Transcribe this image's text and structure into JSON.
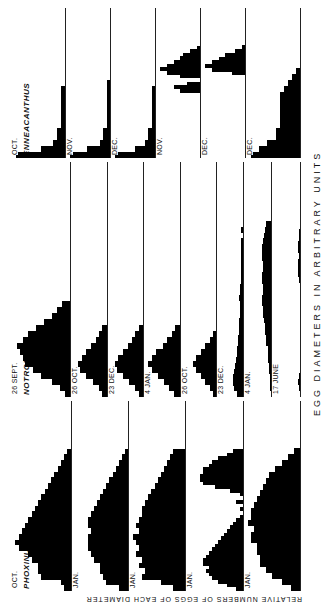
{
  "figure": {
    "y_axis_label": "RELATIVE NUMBERS OF EGGS OF EACH DIAMETER",
    "x_axis_label": "EGG DIAMETERS IN ARBITRARY UNITS"
  },
  "chart_data": [
    {
      "type": "bar",
      "title": "PHOXINUS",
      "xlabel": "EGG DIAMETERS IN ARBITRARY UNITS",
      "ylabel": "RELATIVE NUMBERS OF EGGS OF EACH DIAMETER",
      "panels": [
        {
          "date": "OCT.",
          "condition": [
            "INITIAL CONTROL",
            "FROM NATURE"
          ],
          "values": [
            2,
            3,
            9,
            10,
            10,
            12,
            13,
            16,
            17,
            16,
            15,
            14,
            13,
            12,
            11,
            10,
            9,
            8,
            7,
            6,
            5,
            4,
            3,
            2,
            1
          ]
        },
        {
          "date": "JAN.",
          "condition": [
            "SHORT PHOTOPERIOD",
            "(NORMAL DAYLIGHT)",
            "17°C"
          ],
          "values": [
            3,
            7,
            8,
            9,
            9,
            11,
            12,
            13,
            13,
            13,
            12,
            13,
            13,
            12,
            11,
            10,
            9,
            8,
            7,
            6,
            5,
            4,
            3,
            2,
            1
          ]
        },
        {
          "date": "JAN.",
          "condition": [
            "LONG PHOTOPERIOD",
            "(17 HOURS PER DAY)",
            "7°C"
          ],
          "values": [
            4,
            8,
            14,
            13,
            15,
            14,
            16,
            15,
            16,
            17,
            15,
            16,
            15,
            14,
            14,
            13,
            12,
            11,
            10,
            9,
            8,
            7,
            6,
            5,
            4
          ]
        },
        {
          "date": "JAN.",
          "condition": [
            "LONG PHOTOPERIOD",
            "(17 HOURS PER DAY)",
            "17°C"
          ],
          "values": [
            2,
            5,
            8,
            10,
            11,
            12,
            11,
            13,
            13,
            12,
            11,
            10,
            9,
            8,
            7,
            6,
            5,
            4,
            3,
            2,
            1,
            0,
            1,
            0,
            2,
            0,
            1,
            4,
            9,
            13,
            14,
            14,
            13,
            13,
            11,
            10,
            8,
            5,
            3
          ]
        },
        {
          "date": "JAN.",
          "condition": [
            "SHORT PHOTOPERIOD",
            "(NORMAL DAYLIGHT)",
            "7°C"
          ],
          "values": [
            3,
            6,
            9,
            11,
            13,
            13,
            14,
            14,
            16,
            16,
            15,
            17,
            16,
            16,
            15,
            14,
            13,
            12,
            11,
            10,
            8,
            6,
            4,
            2
          ]
        }
      ]
    },
    {
      "type": "bar",
      "title": "NOTROPIS",
      "xlabel": "EGG DIAMETERS IN ARBITRARY UNITS",
      "ylabel": "RELATIVE NUMBERS OF EGGS OF EACH DIAMETER",
      "panels": [
        {
          "date": "26 SEPT.",
          "condition": [
            "INITIAL CONTROL",
            "FROM NATURE"
          ],
          "values": [
            2,
            4,
            7,
            11,
            14,
            17,
            18,
            19,
            20,
            18,
            16,
            13,
            10,
            7,
            5,
            3
          ]
        },
        {
          "date": "26 OCT.",
          "condition": [
            "SHORT PHOTOPERIOD",
            "(NORMAL DAYLIGHT)",
            "18.9°C"
          ],
          "values": [
            3,
            5,
            9,
            13,
            17,
            18,
            16,
            13,
            10,
            7,
            5,
            3
          ]
        },
        {
          "date": "23 DEC.",
          "condition": [
            "SHORT PHOTOPERIOD",
            "(NORMAL DAYLIGHT)",
            "18.9°C"
          ],
          "values": [
            3,
            5,
            9,
            13,
            17,
            18,
            16,
            13,
            10,
            7,
            5,
            3
          ]
        },
        {
          "date": "4 JAN.",
          "condition": [
            "SHORT PHOTOPERIOD",
            "(NORMAL DAYLIGHT)",
            "18.9°C"
          ],
          "values": [
            4,
            7,
            10,
            14,
            18,
            20,
            18,
            15,
            11,
            8,
            5,
            3
          ]
        },
        {
          "date": "26 OCT.",
          "condition": [
            "LONG PHOTOPERIOD",
            "(17 HOURS PER DAY)",
            "18.9°C"
          ],
          "values": [
            2,
            4,
            7,
            10,
            13,
            15,
            13,
            10,
            7,
            4,
            2
          ]
        },
        {
          "date": "23 DEC.",
          "condition": [
            "LONG PHOTOPERIOD",
            "(17 HOURS PER DAY)",
            "18.9°C"
          ],
          "values": [
            5,
            8,
            9,
            9,
            8,
            7,
            6,
            5,
            5,
            4,
            4,
            3,
            3,
            3,
            2,
            2,
            2,
            3,
            2,
            2,
            1,
            1,
            1,
            1,
            1,
            1,
            1,
            1,
            0,
            1,
            0
          ]
        },
        {
          "date": "4 JAN.",
          "condition": [
            "LONG PHOTOPERIOD",
            "(17 HOURS PER DAY)",
            "18.9°C"
          ],
          "values": [
            0,
            1,
            1,
            1,
            2,
            2,
            3,
            3,
            3,
            4,
            4,
            5,
            5,
            6,
            7,
            7,
            8,
            8,
            7,
            7,
            8,
            8,
            7,
            7,
            8,
            8,
            8,
            7,
            6,
            5,
            4
          ]
        },
        {
          "date": "17 JUNE",
          "condition": [
            "DAYLIGHT SINCE SEPT. 26",
            "18.9°C"
          ],
          "values": [
            0,
            1,
            2,
            1,
            0,
            0,
            0,
            0,
            0,
            0,
            0,
            0,
            0,
            0,
            0,
            0,
            0,
            0,
            0,
            1,
            2,
            2,
            2,
            1,
            2,
            2,
            1,
            1,
            0
          ]
        }
      ]
    },
    {
      "type": "bar",
      "title": "ENNEACANTHUS",
      "xlabel": "EGG DIAMETERS IN ARBITRARY UNITS",
      "ylabel": "RELATIVE NUMBERS OF EGGS OF EACH DIAMETER",
      "panels": [
        {
          "date": "OCT.",
          "condition": [
            "INITIAL CONTROL",
            "FROM NATURE"
          ],
          "values": [
            12,
            6,
            3,
            2,
            2,
            1,
            1,
            1,
            1,
            1,
            1,
            1
          ]
        },
        {
          "date": "NOV.",
          "condition": [
            "SHORT PHOTOPERIOD",
            "(NORMAL DAYLIGHT)",
            "21.7°C"
          ],
          "values": [
            12,
            7,
            3,
            2,
            2,
            1,
            1,
            1,
            1,
            1,
            1,
            1,
            1
          ]
        },
        {
          "date": "DEC.",
          "condition": [
            "SHORT PHOTOPERIOD",
            "(NORMAL DAYLIGHT)",
            "21.7°C"
          ],
          "values": [
            12,
            6,
            3,
            2,
            2,
            1,
            1,
            1,
            1,
            1,
            1,
            1
          ]
        },
        {
          "date": "NOV.",
          "condition": [
            "LONG PHOTOPERIOD",
            "(15 HOURS PER DAY)",
            "21.7°C"
          ],
          "values": [
            0,
            0,
            0,
            0,
            0,
            0,
            0,
            0,
            0,
            0,
            0,
            0,
            0,
            0,
            0,
            0,
            0,
            0,
            6,
            8,
            4,
            0,
            6,
            10,
            12,
            10,
            8,
            6,
            5,
            3,
            1
          ]
        },
        {
          "date": "DEC.",
          "condition": [
            "LONG PHOTOPERIOD",
            "(15 HOURS PER DAY)",
            "21.7°C"
          ],
          "values": [
            0,
            0,
            0,
            0,
            0,
            0,
            0,
            0,
            0,
            0,
            0,
            0,
            0,
            0,
            0,
            0,
            0,
            0,
            0,
            0,
            0,
            0,
            4,
            10,
            12,
            10,
            8,
            6,
            3,
            1
          ]
        },
        {
          "date": "DEC.",
          "condition": [
            "SHORT PHOTOPERIOD",
            "FINAL CONTROL",
            "FROM NATURE",
            "1.1°C"
          ],
          "values": [
            12,
            10,
            8,
            6,
            6,
            5,
            5,
            5,
            5,
            5,
            5,
            4,
            3,
            2,
            1
          ]
        }
      ]
    }
  ]
}
